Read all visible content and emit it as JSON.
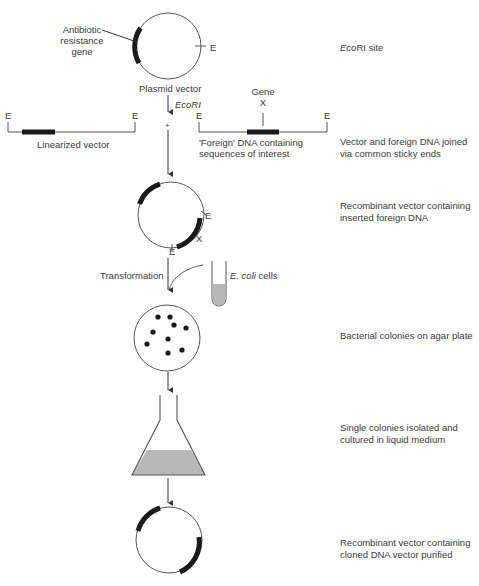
{
  "colors": {
    "line": "#555555",
    "gene_block": "#1a1a1a",
    "liquid": "#b8b8b8",
    "text": "#3a3a3a"
  },
  "labels": {
    "antibiotic_gene": [
      "Antibiotic",
      "resistance",
      "gene"
    ],
    "plasmid_vector": "Plasmid vector",
    "ecori_enzyme": "EcoRI",
    "site_E": "E",
    "gene_x": [
      "Gene",
      "X"
    ],
    "linearized_vector": "Linearized vector",
    "foreign_dna": [
      "'Foreign' DNA containing",
      "sequences of interest"
    ],
    "plus": "+",
    "x_marker": "X",
    "transformation": "Transformation",
    "ecoli_cells_italic": "E. coli",
    "ecoli_cells_rest": " cells"
  },
  "steps": [
    {
      "id": "ecori-site",
      "italic": "Eco",
      "text": "RI site"
    },
    {
      "id": "joined",
      "lines": [
        "Vector and foreign DNA joined",
        "via common sticky ends"
      ]
    },
    {
      "id": "recombinant",
      "lines": [
        "Recombinant vector containing",
        "inserted foreign DNA"
      ]
    },
    {
      "id": "colonies",
      "lines": [
        "Bacterial colonies on agar plate"
      ]
    },
    {
      "id": "cultured",
      "lines": [
        "Single colonies isolated and",
        "cultured in liquid medium"
      ]
    },
    {
      "id": "purified",
      "lines": [
        "Recombinant vector containing",
        "cloned DNA vector purified"
      ]
    }
  ],
  "colony_count": 9
}
